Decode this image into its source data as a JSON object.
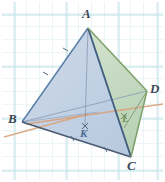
{
  "figure": {
    "kind": "tetrahedron-diagram",
    "caption": "",
    "background": {
      "paper": "#ffffff",
      "grid_color": "#cfe9ec",
      "grid_spacing_px": 13
    },
    "colors": {
      "face_left": "#c2d2e6",
      "face_right": "#c8dcc2",
      "face_bottom": "#bccde2",
      "edge_blue": "#5b7fa6",
      "edge_green": "#7ea06a",
      "edge_dark": "#4a5a70",
      "construction_line": "#d8a07a",
      "label_dark": "#3c4654",
      "label_k": "#4a6a93",
      "label_l": "#6f9157"
    },
    "vertices": [
      {
        "name": "A",
        "label": "A",
        "x": 88,
        "y": 28,
        "label_x": 82,
        "label_y": 7
      },
      {
        "name": "B",
        "label": "B",
        "x": 22,
        "y": 122,
        "label_x": 8,
        "label_y": 112
      },
      {
        "name": "C",
        "label": "C",
        "x": 131,
        "y": 157,
        "label_x": 127,
        "label_y": 159
      },
      {
        "name": "D",
        "label": "D",
        "x": 147,
        "y": 91,
        "label_x": 150,
        "label_y": 82
      }
    ],
    "points": [
      {
        "name": "K",
        "label": "K",
        "x": 85,
        "y": 126,
        "label_x": 80,
        "label_y": 128
      },
      {
        "name": "L",
        "label": "L",
        "x": 125,
        "y": 116,
        "label_x": 122,
        "label_y": 113
      }
    ],
    "edges": [
      {
        "from": "A",
        "to": "B",
        "style": "solid",
        "color": "#5b7fa6"
      },
      {
        "from": "A",
        "to": "C",
        "style": "solid",
        "color": "#46627f"
      },
      {
        "from": "A",
        "to": "D",
        "style": "solid",
        "color": "#7ea06a"
      },
      {
        "from": "B",
        "to": "C",
        "style": "solid",
        "color": "#4a5a70"
      },
      {
        "from": "C",
        "to": "D",
        "style": "solid",
        "color": "#7ea06a"
      },
      {
        "from": "B",
        "to": "D",
        "style": "thin",
        "color": "#7d90aa"
      }
    ],
    "segments": [
      {
        "name": "A-K",
        "from": "A",
        "to": "K",
        "style": "thin",
        "color": "#7d90aa"
      },
      {
        "name": "D-L",
        "from": "D",
        "to": "L",
        "style": "thin",
        "color": "#7a9a66"
      },
      {
        "name": "B-L-ext",
        "style": "construction",
        "color": "#d8a07a"
      },
      {
        "name": "K-line-ext",
        "style": "construction",
        "color": "#d8a07a"
      }
    ],
    "faces": [
      {
        "name": "ABC",
        "vertices": [
          "A",
          "B",
          "C"
        ],
        "fill": "#c2d2e6"
      },
      {
        "name": "ACD",
        "vertices": [
          "A",
          "C",
          "D"
        ],
        "fill": "#c8dcc2"
      },
      {
        "name": "ABD",
        "vertices": [
          "A",
          "B",
          "D"
        ],
        "fill": "#cbd8e8"
      },
      {
        "name": "BCD",
        "vertices": [
          "B",
          "C",
          "D"
        ],
        "fill": "#bccde2"
      }
    ]
  }
}
